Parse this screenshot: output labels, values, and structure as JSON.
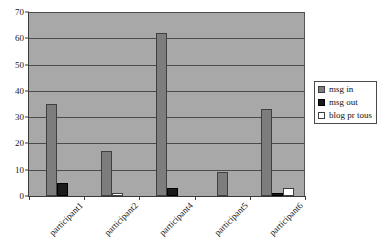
{
  "chart_data": {
    "type": "bar",
    "title": "",
    "xlabel": "",
    "ylabel": "",
    "ylim": [
      0,
      70
    ],
    "ytick_step": 10,
    "yticks": [
      0,
      10,
      20,
      30,
      40,
      50,
      60,
      70
    ],
    "grid": true,
    "legend_position": "right",
    "categories": [
      "participant1",
      "participant2",
      "participant4",
      "participant5",
      "participant6"
    ],
    "series": [
      {
        "name": "msg in",
        "color": "#7d7d7d",
        "values": [
          35,
          17,
          62,
          9,
          33
        ]
      },
      {
        "name": "msg out",
        "color": "#1a1a1a",
        "values": [
          5,
          0,
          3,
          0,
          1
        ]
      },
      {
        "name": "blog pr tous",
        "color": "#ffffff",
        "values": [
          0,
          1,
          0,
          0,
          3
        ]
      }
    ]
  },
  "legend": {
    "items": [
      {
        "label": "msg in"
      },
      {
        "label": "msg out"
      },
      {
        "label": "blog pr tous"
      }
    ]
  },
  "colors": {
    "plot_background": "#a8a8a8",
    "gridline": "#4a4a4a",
    "axis": "#3a3a3a",
    "page_background": "#ffffff"
  }
}
